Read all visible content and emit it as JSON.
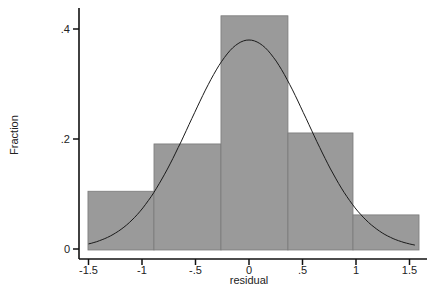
{
  "chart_data": {
    "type": "bar",
    "subtype": "histogram_with_normal_density_overlay",
    "title": "",
    "xlabel": "residual",
    "ylabel": "Fraction",
    "bins": [
      {
        "start": -1.505,
        "end": -0.888,
        "value": 0.105
      },
      {
        "start": -0.888,
        "end": -0.262,
        "value": 0.191
      },
      {
        "start": -0.262,
        "end": 0.364,
        "value": 0.424
      },
      {
        "start": 0.364,
        "end": 0.972,
        "value": 0.211
      },
      {
        "start": 0.972,
        "end": 1.589,
        "value": 0.062
      }
    ],
    "categories": [
      "-1.5 to -0.89",
      "-0.89 to -0.26",
      "-0.26 to 0.36",
      "0.36 to 0.97",
      "0.97 to 1.59"
    ],
    "values": [
      0.105,
      0.191,
      0.424,
      0.211,
      0.062
    ],
    "overlay": {
      "type": "line",
      "name": "normal density",
      "mean": 0.0,
      "sd": 0.55,
      "peak": 0.38,
      "x_range": [
        -1.5,
        1.55
      ]
    },
    "xticks": [
      -1.5,
      -1,
      -0.5,
      0,
      0.5,
      1,
      1.5
    ],
    "xtick_labels": [
      "-1.5",
      "-1",
      "-.5",
      "0",
      ".5",
      "1",
      "1.5"
    ],
    "yticks": [
      0,
      0.2,
      0.4
    ],
    "ytick_labels": [
      "0",
      ".2",
      ".4"
    ],
    "xlim": [
      -1.59,
      1.67
    ],
    "ylim": [
      0,
      0.44
    ],
    "grid": false,
    "legend": null,
    "colors": {
      "bar_fill": "#9a9a9a",
      "bar_edge": "#7a7a7a",
      "curve": "#1a1a1a",
      "axis": "#111111"
    }
  }
}
